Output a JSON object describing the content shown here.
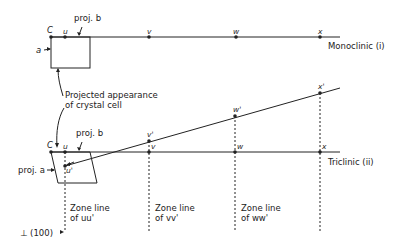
{
  "diagram": {
    "monoclinic": {
      "label": "Monoclinic (i)",
      "points": {
        "C": "C",
        "u": "u",
        "v": "v",
        "w": "w",
        "x": "x"
      },
      "proj_b": "proj. b",
      "a_label": "a"
    },
    "annotation": {
      "line1": "Projected appearance",
      "line2": "of crystal cell"
    },
    "triclinic": {
      "label": "Triclinic (ii)",
      "points": {
        "C": "C",
        "u": "u",
        "v": "v",
        "w": "w",
        "x": "x"
      },
      "primed": {
        "u": "u'",
        "v": "v'",
        "w": "w'",
        "x": "x'"
      },
      "proj_b": "proj. b",
      "proj_a": "proj. a"
    },
    "zone_lines": [
      {
        "line1": "Zone line",
        "line2": "of uu'"
      },
      {
        "line1": "Zone line",
        "line2": "of vv'"
      },
      {
        "line1": "Zone line",
        "line2": "of ww'"
      }
    ],
    "perp_label": "⊥ (100)"
  }
}
